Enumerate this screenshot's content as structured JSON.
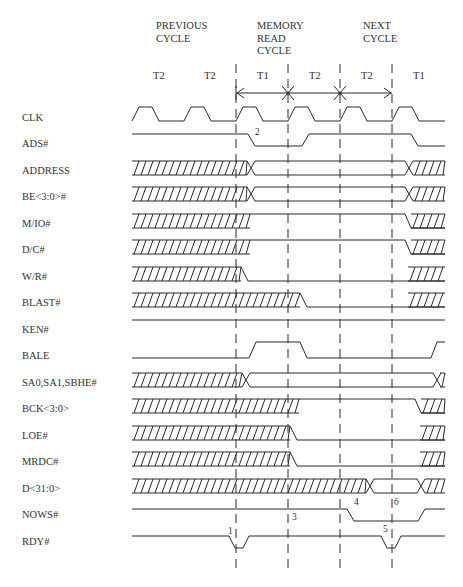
{
  "headers": [
    {
      "id": "previous",
      "lines": [
        "PREVIOUS",
        "CYCLE"
      ],
      "x": 156,
      "y": 20
    },
    {
      "id": "memory_read",
      "lines": [
        "MEMORY",
        "READ",
        "CYCLE"
      ],
      "x": 257,
      "y": 20
    },
    {
      "id": "next",
      "lines": [
        "NEXT",
        "CYCLE"
      ],
      "x": 363,
      "y": 20
    }
  ],
  "t_states": [
    {
      "label": "T2",
      "x": 153
    },
    {
      "label": "T2",
      "x": 204
    },
    {
      "label": "T1",
      "x": 257
    },
    {
      "label": "T2",
      "x": 309
    },
    {
      "label": "T2",
      "x": 361
    },
    {
      "label": "T1",
      "x": 413
    }
  ],
  "dividers_x": [
    236,
    288,
    340,
    392
  ],
  "signals": [
    {
      "name": "CLK",
      "y": 118
    },
    {
      "name": "ADS#",
      "y": 144
    },
    {
      "name": "ADDRESS",
      "y": 171
    },
    {
      "name": "BE<3:0>#",
      "y": 197
    },
    {
      "name": "M/IO#",
      "y": 224
    },
    {
      "name": "D/C#",
      "y": 250
    },
    {
      "name": "W/R#",
      "y": 277
    },
    {
      "name": "BLAST#",
      "y": 303
    },
    {
      "name": "KEN#",
      "y": 330
    },
    {
      "name": "BALE",
      "y": 356
    },
    {
      "name": "SA0,SA1,SBHE#",
      "y": 383
    },
    {
      "name": "BCK<3:0>",
      "y": 409
    },
    {
      "name": "LOE#",
      "y": 436
    },
    {
      "name": "MRDC#",
      "y": 462
    },
    {
      "name": "D<31:0>",
      "y": 489
    },
    {
      "name": "NOWS#",
      "y": 515
    },
    {
      "name": "RDY#",
      "y": 542
    }
  ],
  "annotations": [
    {
      "label": "1",
      "x": 228,
      "y": 532
    },
    {
      "label": "2",
      "x": 255,
      "y": 133
    },
    {
      "label": "3",
      "x": 292,
      "y": 518
    },
    {
      "label": "4",
      "x": 354,
      "y": 503
    },
    {
      "label": "5",
      "x": 383,
      "y": 530
    },
    {
      "label": "6",
      "x": 394,
      "y": 503
    }
  ],
  "colors": {
    "line": "#2a2a2a",
    "text": "#333333",
    "background": "#ffffff"
  }
}
